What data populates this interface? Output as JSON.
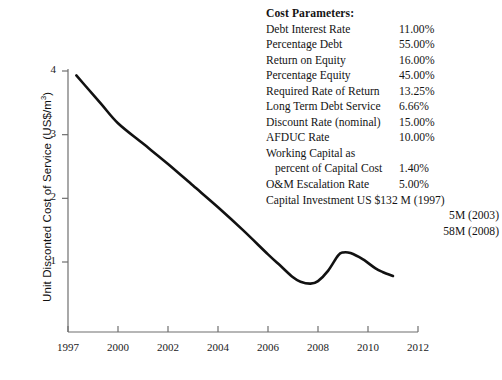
{
  "chart_data": {
    "type": "line",
    "title": "",
    "xlabel": "",
    "ylabel": "Unit Disconted Cost of Service (US$/m3)",
    "ylabel_parts": {
      "main": "Unit Disconted Cost of Service (US$/m",
      "sup": "3",
      "tail": ")"
    },
    "xtick_labels": [
      "1997",
      "2000",
      "2002",
      "2004",
      "2006",
      "2008",
      "2010",
      "2012"
    ],
    "ytick_labels": [
      "1",
      "2",
      "3",
      "4"
    ],
    "ytick_values": [
      1,
      2,
      3,
      4
    ],
    "xlim": [
      1997,
      2012
    ],
    "ylim": [
      0,
      4.35
    ],
    "grid": false,
    "legend": false,
    "line_color": "#111111",
    "series": [
      {
        "name": "Unit Discounted Cost of Service",
        "x": [
          1997.5,
          1998.0,
          1999.0,
          2000.0,
          2001.0,
          2002.0,
          2003.0,
          2004.0,
          2005.0,
          2006.0,
          2006.5,
          2007.0,
          2007.3,
          2007.7,
          2008.0,
          2008.4,
          2008.8,
          2009.0,
          2009.3,
          2009.8,
          2010.3,
          2010.6,
          2011.0
        ],
        "y": [
          3.93,
          3.78,
          3.48,
          3.18,
          2.86,
          2.54,
          2.2,
          1.86,
          1.5,
          1.12,
          0.94,
          0.76,
          0.69,
          0.66,
          0.7,
          0.86,
          1.1,
          1.15,
          1.14,
          1.04,
          0.9,
          0.84,
          0.78
        ]
      }
    ]
  },
  "params": {
    "title": "Cost Parameters:",
    "rows": [
      {
        "label": "Debt Interest Rate",
        "value": "11.00%"
      },
      {
        "label": "Percentage Debt",
        "value": "55.00%"
      },
      {
        "label": "Return on Equity",
        "value": "16.00%"
      },
      {
        "label": "Percentage Equity",
        "value": "45.00%"
      },
      {
        "label": "Required Rate of Return",
        "value": "13.25%"
      },
      {
        "label": "Long Term Debt Service",
        "value": "6.66%"
      },
      {
        "label": "Discount Rate (nominal)",
        "value": "15.00%"
      },
      {
        "label": "AFDUC Rate",
        "value": "10.00%"
      },
      {
        "label": "Working Capital as",
        "value": ""
      },
      {
        "label": "percent of Capital Cost",
        "value": "1.40%"
      },
      {
        "label": "O&M Escalation Rate",
        "value": "5.00%"
      }
    ],
    "capital_investment": "Capital Investment US $132  M (1997)",
    "capital_investment_cont": [
      "5M (2003)",
      "58M (2008)"
    ]
  }
}
